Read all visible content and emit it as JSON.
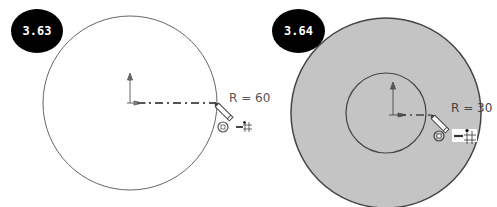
{
  "figures": [
    {
      "id": "3.63",
      "badge_label": "3.63",
      "radius_label": "R = 60",
      "description": "Single circle sketch with radius dimension preview",
      "colors": {
        "fill": "#ffffff",
        "stroke": "#555555"
      }
    },
    {
      "id": "3.64",
      "badge_label": "3.64",
      "radius_label": "R = 30",
      "description": "Inner circle sketched inside shaded outer circle",
      "colors": {
        "fill": "#c4c4c4",
        "stroke": "#444444"
      }
    }
  ],
  "icons": [
    "origin-axis-icon",
    "pencil-cursor-icon",
    "concentric-target-icon",
    "horizontal-grid-snap-icon"
  ],
  "colors": {
    "badge_bg": "#000000",
    "badge_text": "#ffffff",
    "background": "#ffffff"
  }
}
